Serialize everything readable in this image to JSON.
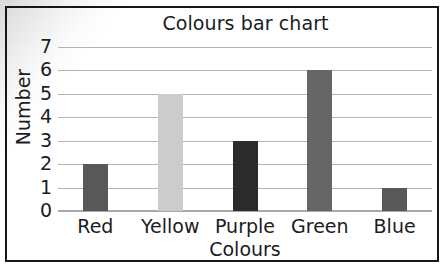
{
  "chart_data": {
    "type": "bar",
    "title": "Colours bar chart",
    "xlabel": "Colours",
    "ylabel": "Number",
    "categories": [
      "Red",
      "Yellow",
      "Purple",
      "Green",
      "Blue"
    ],
    "values": [
      2,
      5,
      3,
      6,
      1
    ],
    "bar_colors": [
      "#585858",
      "#cccccc",
      "#2b2b2b",
      "#666666",
      "#585858"
    ],
    "ylim": [
      0,
      7
    ],
    "ytick_labels": [
      "7",
      "6",
      "5",
      "4",
      "3",
      "2",
      "1",
      "0"
    ],
    "ytick_values": [
      7,
      6,
      5,
      4,
      3,
      2,
      1,
      0
    ],
    "grid": true,
    "legend": "none",
    "frame_color": "#15161a",
    "gridline_color": "#b3b3b3",
    "text_color": "#1b1c1f"
  }
}
